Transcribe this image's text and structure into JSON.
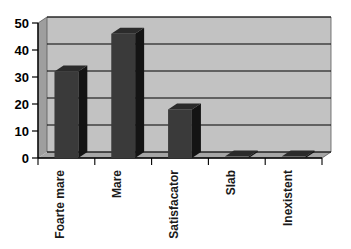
{
  "chart_data": {
    "type": "bar",
    "title": "",
    "subtitle": "",
    "xlabel": "",
    "ylabel": "",
    "categories": [
      "Foarte mare",
      "Mare",
      "Satisfacator",
      "Slab",
      "Inexistent"
    ],
    "values": [
      32,
      46,
      18,
      0,
      0
    ],
    "ylim": [
      0,
      50
    ],
    "yticks": [
      0,
      10,
      20,
      30,
      40,
      50
    ],
    "ytick_labels": [
      "0",
      "10",
      "20",
      "30",
      "40",
      "50"
    ],
    "grid": true,
    "grid_axis": "y",
    "legend": false,
    "legend_position": "none",
    "three_d": true,
    "series": [
      {
        "name": "Series 1",
        "values": [
          32,
          46,
          18,
          0,
          0
        ]
      }
    ]
  },
  "style": {
    "background_color": "#ffffff",
    "plot_wall_color": "#c0c0c0",
    "plot_floor_color": "#a8a8a8",
    "bar_front_color": "#3a3a3a",
    "bar_top_color": "#2b2b2b",
    "bar_side_color": "#141414",
    "gridline_color": "#000000",
    "axis_color": "#000000",
    "tick_label_color": "#000000",
    "category_label_color": "#1a1a1a"
  }
}
